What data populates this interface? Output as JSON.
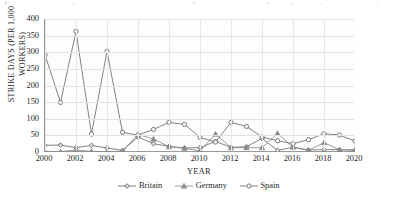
{
  "chart_data": {
    "type": "line",
    "title": "",
    "xlabel": "YEAR",
    "ylabel": "STRIKE DAYS (PER 1,000 WORKERS)",
    "ylabel_line1": "STRIKE DAYS (PER 1,000",
    "ylabel_line2": "WORKERS)",
    "x": [
      2000,
      2001,
      2002,
      2003,
      2004,
      2005,
      2006,
      2007,
      2008,
      2009,
      2010,
      2011,
      2012,
      2013,
      2014,
      2015,
      2016,
      2017,
      2018,
      2019,
      2020
    ],
    "xlim": [
      2000,
      2020
    ],
    "ylim": [
      0,
      400
    ],
    "ytick_values": [
      0,
      50,
      100,
      150,
      200,
      250,
      300,
      350,
      400
    ],
    "ytick_labels": [
      "0",
      "50",
      "100",
      "150",
      "200",
      "250",
      "300",
      "350",
      "400"
    ],
    "xtick_values": [
      2000,
      2002,
      2004,
      2006,
      2008,
      2010,
      2012,
      2014,
      2016,
      2018,
      2020
    ],
    "xtick_labels": [
      "2000",
      "2002",
      "2004",
      "2006",
      "2008",
      "2010",
      "2012",
      "2014",
      "2016",
      "2018",
      "2020"
    ],
    "grid": true,
    "legend_position": "bottom-center",
    "series": [
      {
        "name": "Britain",
        "marker": "diamond",
        "color": "#6b6b6b",
        "values": [
          20,
          21,
          13,
          20,
          12,
          5,
          45,
          25,
          17,
          12,
          13,
          32,
          14,
          16,
          41,
          5,
          14,
          6,
          7,
          7,
          5
        ]
      },
      {
        "name": "Germany",
        "marker": "triangle",
        "color": "#8a8a8a",
        "values": [
          2,
          1,
          6,
          2,
          1,
          2,
          53,
          39,
          16,
          11,
          3,
          54,
          13,
          13,
          13,
          56,
          15,
          5,
          28,
          7,
          7
        ]
      },
      {
        "name": "Spain",
        "marker": "circle",
        "color": "#6b6b6b",
        "values": [
          292,
          149,
          363,
          54,
          303,
          59,
          51,
          68,
          89,
          83,
          44,
          30,
          89,
          77,
          45,
          34,
          25,
          37,
          55,
          51,
          33
        ]
      }
    ]
  },
  "legend": {
    "items": [
      {
        "label": "Britain",
        "marker": "diamond"
      },
      {
        "label": "Germany",
        "marker": "triangle"
      },
      {
        "label": "Spain",
        "marker": "circle"
      }
    ]
  }
}
